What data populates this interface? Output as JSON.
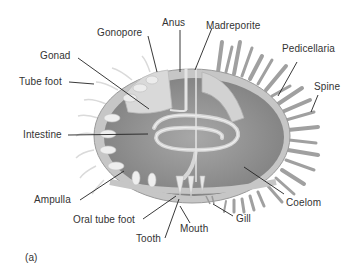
{
  "figure": {
    "panel_label": "(a)",
    "colors": {
      "body_fill": "#8e8e8e",
      "body_wall": "#c9c9c9",
      "organ_fill": "#d8d8d8",
      "spine": "#9a9a9a",
      "line": "#222222",
      "text": "#333333"
    }
  },
  "labels": {
    "gonopore": "Gonopore",
    "anus": "Anus",
    "madreporite": "Madreporite",
    "pedicellaria": "Pedicellaria",
    "gonad": "Gonad",
    "tube_foot": "Tube foot",
    "spine": "Spine",
    "intestine": "Intestine",
    "ampulla": "Ampulla",
    "oral_tube_foot": "Oral tube foot",
    "tooth": "Tooth",
    "mouth": "Mouth",
    "gill": "Gill",
    "coelom": "Coelom"
  }
}
